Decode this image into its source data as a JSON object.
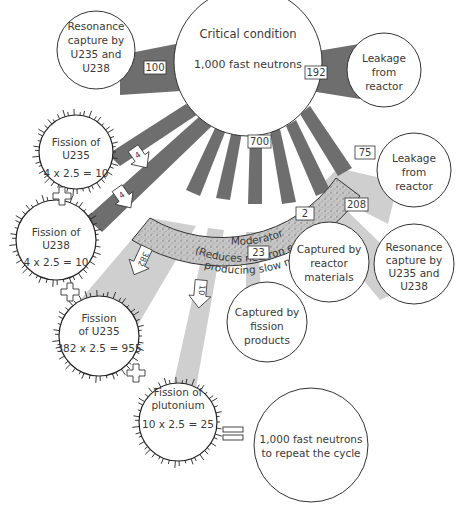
{
  "diagram": {
    "colors": {
      "dark_stream": "#6e6e6e",
      "light_stream": "#cfcfcf",
      "moderator_fill": "#b9b9b9",
      "outline": "#333333"
    },
    "source": {
      "line1": "Critical condition",
      "line2": "1,000 fast neutrons"
    },
    "resonance_left": {
      "lines": [
        "Resonance",
        "capture by",
        "U235 and",
        "U238"
      ],
      "flow": "100"
    },
    "leakage_top": {
      "lines": [
        "Leakage",
        "from",
        "reactor"
      ],
      "flow": "192"
    },
    "moderator": {
      "title": "Moderator",
      "line2": "(Reduces neutron energy,",
      "line3": "producing slow neutrons)",
      "flow_in": "700"
    },
    "leakage_slow": {
      "lines": [
        "Leakage",
        "from",
        "reactor"
      ],
      "flow": "75"
    },
    "resonance_right": {
      "lines": [
        "Resonance",
        "capture by",
        "U235 and",
        "U238"
      ],
      "flow": "208"
    },
    "reactor_materials": {
      "lines": [
        "Captured by",
        "reactor",
        "materials"
      ],
      "flow": "2"
    },
    "fission_products": {
      "lines": [
        "Captured by",
        "fission",
        "products"
      ],
      "flow": "23"
    },
    "fission_u235_fast": {
      "lines": [
        "Fission of",
        "U235"
      ],
      "equation": "4 x 2.5 = 10",
      "flow": "4"
    },
    "fission_u238": {
      "lines": [
        "Fission of",
        "U238"
      ],
      "equation": "4 x 2.5 = 10",
      "flow": "4"
    },
    "fission_u235_slow": {
      "lines": [
        "Fission",
        "of U235"
      ],
      "equation": "382 x 2.5 = 955",
      "flow": "382"
    },
    "fission_plutonium": {
      "lines": [
        "Fission of",
        "plutonium"
      ],
      "equation": "10 x 2.5 = 25",
      "flow": "10"
    },
    "result": {
      "line1": "1,000 fast neutrons",
      "line2": "to repeat the cycle"
    },
    "operators": {
      "plus": "+",
      "equals": "="
    }
  }
}
